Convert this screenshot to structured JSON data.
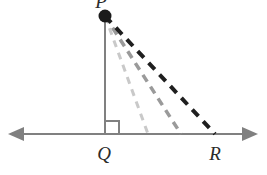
{
  "figure": {
    "type": "geometry-diagram",
    "background_color": "#ffffff",
    "canvas": {
      "width": 267,
      "height": 175
    },
    "points": [
      {
        "id": "P",
        "label": "P",
        "x": 105,
        "y": 16,
        "marker": "filled-dot",
        "marker_radius": 6,
        "marker_color": "#1a1a1a",
        "label_x": 104,
        "label_y": 8,
        "label_clipped": true
      },
      {
        "id": "Q",
        "label": "Q",
        "x": 105,
        "y": 134,
        "marker": "none",
        "label_x": 98,
        "label_y": 158
      },
      {
        "id": "R",
        "label": "R",
        "x": 215,
        "y": 134,
        "marker": "none",
        "label_x": 208,
        "label_y": 158
      }
    ],
    "baseline": {
      "name": "horizontal-line-QR",
      "y": 134,
      "x_start": 8,
      "x_end": 258,
      "color": "#808080",
      "stroke_width": 2,
      "arrow_left": true,
      "arrow_right": true,
      "arrow_color": "#808080"
    },
    "altitude": {
      "name": "segment-PQ",
      "x": 105,
      "y_top": 16,
      "y_bottom": 134,
      "color": "#808080",
      "stroke_width": 2
    },
    "right_angle_marker": {
      "name": "right-angle-at-Q",
      "x": 106,
      "y": 121,
      "size": 13,
      "color": "#808080",
      "stroke_width": 2
    },
    "rays": [
      {
        "name": "dashed-ray-1-light",
        "from_x": 105,
        "from_y": 16,
        "to_x": 148,
        "to_y": 134,
        "color": "#c9c9c9",
        "stroke_width": 3,
        "dash": "7 6",
        "shade": "light-gray"
      },
      {
        "name": "dashed-ray-2-medium",
        "from_x": 105,
        "from_y": 16,
        "to_x": 181,
        "to_y": 134,
        "color": "#9a9a9a",
        "stroke_width": 3.5,
        "dash": "8 6",
        "shade": "medium-gray"
      },
      {
        "name": "dashed-ray-3-dark",
        "from_x": 105,
        "from_y": 16,
        "to_x": 215,
        "to_y": 134,
        "color": "#1f1f1f",
        "stroke_width": 4,
        "dash": "9 7",
        "shade": "black"
      }
    ]
  }
}
